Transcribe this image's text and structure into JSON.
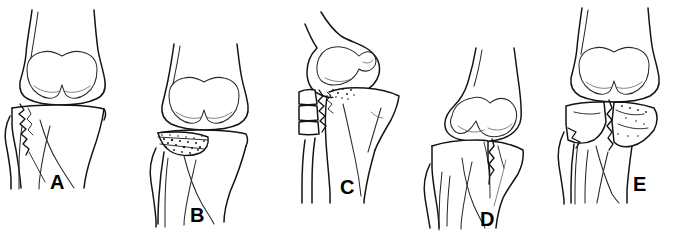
{
  "figure": {
    "background_color": "#ffffff",
    "ink_color": "#141414",
    "width": 689,
    "height": 240,
    "panel_count": 5
  },
  "panels": [
    {
      "label": "A",
      "label_x": 50,
      "label_y": 172,
      "description": "Pure split (wedge) fracture of the lateral tibial plateau, anteroposterior view of knee with distal femur, proximal tibia and fibula",
      "view": "anteroposterior",
      "fracture_pattern": "split",
      "bones": [
        "femur",
        "tibia",
        "fibula"
      ]
    },
    {
      "label": "B",
      "label_x": 190,
      "label_y": 205,
      "description": "Pure central depression fracture of the lateral tibial plateau with comminuted impacted subchondral bone",
      "view": "anteroposterior",
      "fracture_pattern": "depression",
      "bones": [
        "femur",
        "tibia",
        "fibula"
      ]
    },
    {
      "label": "C",
      "label_x": 340,
      "label_y": 177,
      "description": "Split-depression fracture of the lateral tibial plateau with displaced lateral wedge fragment, oblique view",
      "view": "oblique",
      "fracture_pattern": "split-depression",
      "bones": [
        "femur",
        "tibia",
        "fibula"
      ]
    },
    {
      "label": "D",
      "label_x": 480,
      "label_y": 209,
      "description": "Medial tibial plateau fracture with oblique fracture line extending into the metaphysis",
      "view": "anteroposterior",
      "fracture_pattern": "medial-condyle",
      "bones": [
        "femur",
        "tibia",
        "fibula"
      ]
    },
    {
      "label": "E",
      "label_x": 633,
      "label_y": 174,
      "description": "Bicondylar tibial plateau fracture involving both medial and lateral plateaus with metaphyseal comminution",
      "view": "anteroposterior",
      "fracture_pattern": "bicondylar",
      "bones": [
        "femur",
        "tibia",
        "fibula"
      ]
    }
  ]
}
